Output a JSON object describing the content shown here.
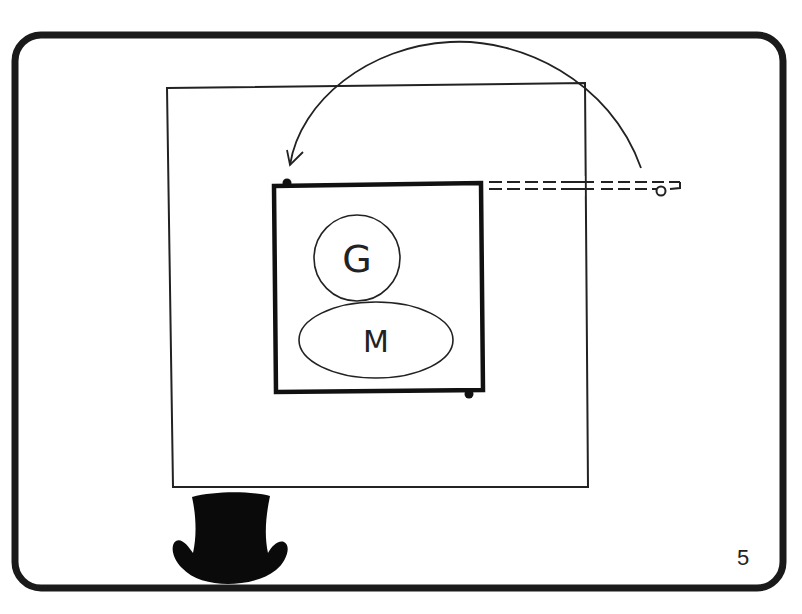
{
  "slide": {
    "page_number": "5",
    "colors": {
      "ink": "#1a1a1a",
      "background": "#ffffff"
    }
  },
  "diagram": {
    "outer_frame": "rounded-slide-border",
    "container": "outer-square",
    "box": {
      "label": "inner-bold-box",
      "nodes": [
        {
          "id": "g",
          "shape": "circle",
          "label": "G"
        },
        {
          "id": "m",
          "shape": "ellipse",
          "label": "M"
        }
      ]
    },
    "connector": {
      "type": "dashed-double-line",
      "end": "loop"
    },
    "arrow": {
      "type": "curved-arrow",
      "direction": "from right loop to top-left of box"
    },
    "icon": "top-hat-icon"
  }
}
